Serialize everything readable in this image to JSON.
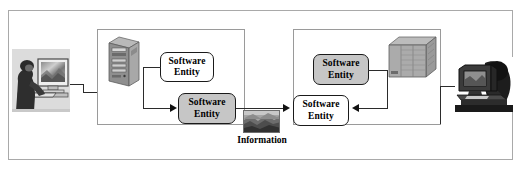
{
  "diagram": {
    "outer_frame": {
      "name": "system-boundary"
    },
    "nodes": [
      {
        "id": "left-host",
        "container_name": "left-host-container",
        "server_icon": "tower-server-icon",
        "entities": [
          {
            "line1": "Software",
            "line2": "Entity",
            "fill": "white"
          },
          {
            "line1": "Software",
            "line2": "Entity",
            "fill": "gray"
          }
        ]
      },
      {
        "id": "right-host",
        "container_name": "right-host-container",
        "server_icon": "rack-server-icon",
        "entities": [
          {
            "line1": "Software",
            "line2": "Entity",
            "fill": "gray"
          },
          {
            "line1": "Software",
            "line2": "Entity",
            "fill": "white"
          }
        ]
      }
    ],
    "information": {
      "label": "Information",
      "thumbnail_name": "information-thumbnail-image"
    },
    "users": [
      {
        "id": "left-user",
        "icon": "user-at-workstation-photo"
      },
      {
        "id": "right-user",
        "icon": "user-at-monitor-photo"
      }
    ],
    "colors": {
      "entity_gray_fill": "#c6c6c6",
      "entity_white_fill": "#ffffff",
      "entity_border": "#1a1a1a",
      "frame_border": "#a9a9a9",
      "container_border": "#9a9a9a",
      "connector": "#2b2b2b",
      "server_body": "#9d9d9d",
      "server_shade": "#7c7c7c",
      "page_background": "#ffffff"
    }
  }
}
